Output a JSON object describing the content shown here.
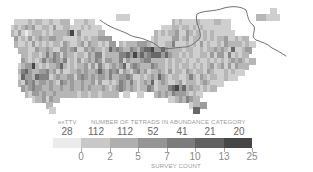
{
  "map": {
    "cell_size": 7,
    "origin_x": 7,
    "origin_y": 8,
    "shades": [
      "#ebebeb",
      "#cfcfcf",
      "#b6b6b6",
      "#9c9c9c",
      "#838383",
      "#686868",
      "#474747"
    ],
    "rows": [
      {
        "r": 0,
        "c0": 32,
        "v": "...........................................1..........."
      },
      {
        "r": 1,
        "c0": 31,
        "v": "1.1.....................................22.1.1..........."
      },
      {
        "r": 2,
        "c0": 2,
        "v": "1111212.1121122..11121.......................21211112111.2211......"
      },
      {
        "r": 3,
        "c0": 1,
        "v": "1212323112213112211121211..................1112212.12121111.11......."
      },
      {
        "r": 4,
        "c0": 1,
        "v": "21310122212122223613111112...............2121223113212121211111......."
      },
      {
        "r": 5,
        "c0": 2,
        "v": "3121312322332211.1212122333............121.11331231221212122311212...."
      },
      {
        "r": 6,
        "c0": 2,
        "v": "2112131212122132112313221213..212223332121122411121213121121322.2121..."
      },
      {
        "r": 7,
        "c0": 3,
        "v": "222113223211332341132322125343224324556335322221221121223232151123......"
      },
      {
        "r": 8,
        "c0": 4,
        "v": "2212212424313221221324412222445363534555353221212112213133141212........"
      },
      {
        "r": 9,
        "c0": 4,
        "v": "321212423432412131232431332241322234422221212212112112121212323212......."
      },
      {
        "r": 10,
        "c0": 3,
        "v": "12336212122352121223131421232351343222432212121221212123123131322......."
      },
      {
        "r": 11,
        "c0": 3,
        "v": "2453223342313112232322353243413213423122321312213212213211121211........"
      },
      {
        "r": 12,
        "c0": 3,
        "v": "15332544412322331343232332422334311212325321221124213212211211.........."
      },
      {
        "r": 13,
        "c0": 3,
        "v": "2143423323214323223223131121243242123251232112312221232111............"
      },
      {
        "r": 14,
        "c0": 4,
        "v": "3234332232232232232322232123432321224312224563523221212..............."
      },
      {
        "r": 15,
        "c0": 5,
        "v": "213323223222222122122122.2..1...1....2323243332121.............."
      },
      {
        "r": 16,
        "c0": 7,
        "v": "12.3132................................1.232432................"
      },
      {
        "r": 17,
        "c0": 11,
        "v": "2........................................12.3................."
      },
      {
        "r": 18,
        "c0": 12,
        "v": "1........................................5..................."
      }
    ]
  },
  "river": {
    "color": "#6f6f6f",
    "path": "M100,20 C110,28 120,30 128,34 C134,38 140,37 146,40 C152,42 156,44 160,48 C168,50 176,47 186,47 C192,46 196,42 200,38 C202,30 194,22 197,14 C204,10 214,12 224,8 C232,6 240,6 246,10 C248,16 248,22 254,26 C256,32 250,36 256,40 C262,42 268,44 272,48 C276,50 280,52 286,56"
  },
  "legend": {
    "extinct_label": "exTTV",
    "title": "NUMBER OF TETRADS IN ABUNDANCE CATEGORY",
    "axis_label": "SURVEY COUNT",
    "counts": [
      "28",
      "112",
      "112",
      "52",
      "41",
      "21",
      "20"
    ],
    "tick_labels": [
      "0",
      "2",
      "5",
      "7",
      "10",
      "13",
      "25"
    ],
    "swatch_colors": [
      "#ebebeb",
      "#c8c8c8",
      "#afafaf",
      "#959595",
      "#7c7c7c",
      "#616161",
      "#464646"
    ]
  }
}
